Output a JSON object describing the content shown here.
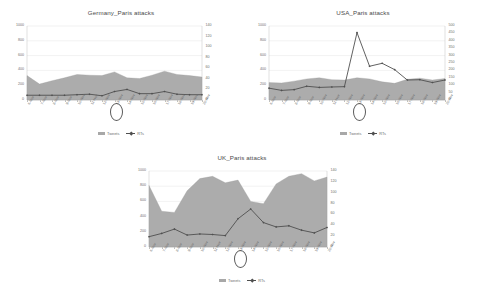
{
  "page": {
    "background": "#ffffff",
    "area_color": "#a8a8a8",
    "line_color": "#4f4f4f",
    "grid_color": "#d9d9d9"
  },
  "legend": {
    "tweets_label": "Tweets",
    "rts_label": "RTs"
  },
  "annotation": {
    "circled_tick": "13-Nov",
    "note": "13-Nov highlighted with an ellipse on every chart"
  },
  "chart_data": [
    {
      "id": "germany",
      "type": "area",
      "title": "Germany_Paris attacks",
      "xlabel": "",
      "ylabel": "",
      "grid": true,
      "legend_position": "bottom",
      "categories": [
        "6-Nov",
        "7-Nov",
        "8-Nov",
        "9-Nov",
        "10-Nov",
        "11-Nov",
        "12-Nov",
        "13-Nov",
        "14-Nov",
        "15-Nov",
        "16-Nov",
        "17-Nov",
        "18-Nov",
        "19-Nov",
        "20-Nov"
      ],
      "y_left": {
        "label": "Tweets",
        "ticks": [
          0,
          200,
          400,
          600,
          800,
          1000
        ],
        "ylim": [
          0,
          1000
        ]
      },
      "y_right": {
        "label": "RTs",
        "ticks": [
          0,
          20,
          40,
          60,
          80,
          100,
          120,
          140
        ],
        "ylim": [
          0,
          140
        ]
      },
      "series": [
        {
          "name": "Tweets",
          "axis": "left",
          "kind": "area",
          "values": [
            330,
            215,
            260,
            300,
            345,
            335,
            330,
            380,
            300,
            290,
            335,
            390,
            345,
            330,
            310
          ]
        },
        {
          "name": "RTs",
          "axis": "right",
          "kind": "line",
          "values": [
            9,
            9,
            9,
            9,
            10,
            11,
            8,
            16,
            20,
            12,
            12,
            16,
            11,
            10,
            10
          ]
        }
      ]
    },
    {
      "id": "usa",
      "type": "area",
      "title": "USA_Paris attacks",
      "xlabel": "",
      "ylabel": "",
      "grid": true,
      "legend_position": "bottom",
      "categories": [
        "6-Nov",
        "7-Nov",
        "8-Nov",
        "9-Nov",
        "10-Nov",
        "11-Nov",
        "12-Nov",
        "13-Nov",
        "14-Nov",
        "15-Nov",
        "16-Nov",
        "17-Nov",
        "18-Nov",
        "19-Nov",
        "20-Nov"
      ],
      "y_left": {
        "label": "Tweets",
        "ticks": [
          0,
          200,
          400,
          600,
          800,
          1000
        ],
        "ylim": [
          0,
          1000
        ]
      },
      "y_right": {
        "label": "RTs",
        "ticks": [
          0,
          50,
          100,
          150,
          200,
          250,
          300,
          350,
          400,
          450,
          500
        ],
        "ylim": [
          0,
          500
        ]
      },
      "series": [
        {
          "name": "Tweets",
          "axis": "left",
          "kind": "area",
          "values": [
            235,
            230,
            255,
            285,
            300,
            275,
            270,
            300,
            285,
            245,
            225,
            280,
            295,
            270,
            290
          ]
        },
        {
          "name": "RTs",
          "axis": "right",
          "kind": "line",
          "values": [
            80,
            65,
            70,
            93,
            85,
            88,
            90,
            455,
            228,
            248,
            205,
            135,
            137,
            118,
            135
          ]
        }
      ]
    },
    {
      "id": "uk",
      "type": "area",
      "title": "UK_Paris attacks",
      "xlabel": "",
      "ylabel": "",
      "grid": true,
      "legend_position": "bottom",
      "categories": [
        "6-Nov",
        "7-Nov",
        "8-Nov",
        "9-Nov",
        "10-Nov",
        "11-Nov",
        "12-Nov",
        "13-Nov",
        "14-Nov",
        "15-Nov",
        "16-Nov",
        "17-Nov",
        "18-Nov",
        "19-Nov",
        "20-Nov"
      ],
      "y_left": {
        "label": "Tweets",
        "ticks": [
          0,
          200,
          400,
          600,
          800,
          1000
        ],
        "ylim": [
          0,
          1000
        ]
      },
      "y_right": {
        "label": "RTs",
        "ticks": [
          0,
          20,
          40,
          60,
          80,
          100,
          120,
          140
        ],
        "ylim": [
          0,
          140
        ]
      },
      "series": [
        {
          "name": "Tweets",
          "axis": "left",
          "kind": "area",
          "values": [
            810,
            470,
            455,
            740,
            900,
            930,
            845,
            880,
            600,
            570,
            830,
            930,
            965,
            870,
            920
          ]
        },
        {
          "name": "RTs",
          "axis": "right",
          "kind": "line",
          "values": [
            19,
            25,
            33,
            22,
            24,
            23,
            21,
            52,
            70,
            45,
            37,
            39,
            31,
            26,
            36
          ]
        }
      ]
    }
  ]
}
